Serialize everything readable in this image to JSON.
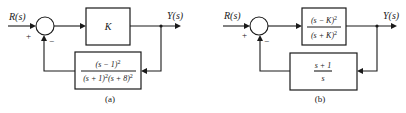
{
  "diagrams": [
    {
      "caption": "(a)",
      "input_label": "R(s)",
      "output_label": "Y(s)",
      "sum_plus": "+",
      "sum_minus": "−",
      "forward_block": {
        "text": "K"
      },
      "feedback_block": {
        "numerator": "(s − 1)",
        "numerator_exp": "2",
        "denominator_a": "(s + 1)",
        "denominator_a_exp": "2",
        "denominator_b": "(s + 8)",
        "denominator_b_exp": "2"
      }
    },
    {
      "caption": "(b)",
      "input_label": "R(s)",
      "output_label": "Y(s)",
      "sum_plus": "+",
      "sum_minus": "−",
      "forward_block": {
        "numerator": "(s − K)",
        "numerator_exp": "2",
        "denominator": "(s + K)",
        "denominator_exp": "2"
      },
      "feedback_block": {
        "numerator": "s + 1",
        "denominator": "s"
      }
    }
  ]
}
